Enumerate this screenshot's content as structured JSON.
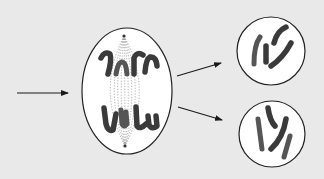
{
  "diagram": {
    "title": "",
    "background_color": "#e9e9e9",
    "nodes": [
      {
        "id": "parent-cell",
        "shape": "ellipse",
        "stage": "anaphase",
        "chromosome_groups": 2,
        "chromosomes_per_group": 4
      },
      {
        "id": "daughter-cell-top",
        "shape": "circle",
        "chromosomes": 3
      },
      {
        "id": "daughter-cell-bottom",
        "shape": "circle",
        "chromosomes": 3
      }
    ],
    "edges": [
      {
        "from": "input",
        "to": "parent-cell"
      },
      {
        "from": "parent-cell",
        "to": "daughter-cell-top"
      },
      {
        "from": "parent-cell",
        "to": "daughter-cell-bottom"
      }
    ],
    "colors": {
      "outline": "#222222",
      "chromosome": "#3a3a3a",
      "spindle": "#777777",
      "cell_fill": "#ffffff"
    }
  }
}
